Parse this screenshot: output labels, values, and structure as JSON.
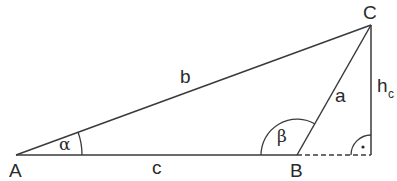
{
  "diagram": {
    "type": "triangle",
    "vertices": {
      "A": {
        "label": "A",
        "x": 16,
        "y": 155
      },
      "B": {
        "label": "B",
        "x": 297,
        "y": 155
      },
      "C": {
        "label": "C",
        "x": 371,
        "y": 25
      }
    },
    "sides": {
      "a": {
        "label": "a",
        "from": "B",
        "to": "C"
      },
      "b": {
        "label": "b",
        "from": "A",
        "to": "C"
      },
      "c": {
        "label": "c",
        "from": "A",
        "to": "B"
      }
    },
    "angles": {
      "alpha": {
        "label": "α",
        "at": "A"
      },
      "beta": {
        "label": "β",
        "at": "B"
      }
    },
    "height": {
      "label": "h",
      "subscript": "c",
      "from": "C",
      "to_foot": true
    },
    "right_angle_marker": {
      "symbol": "·"
    },
    "extension_line": {
      "style": "dashed",
      "from": "B",
      "to": "foot"
    },
    "line_color": "#3a3a3a"
  }
}
